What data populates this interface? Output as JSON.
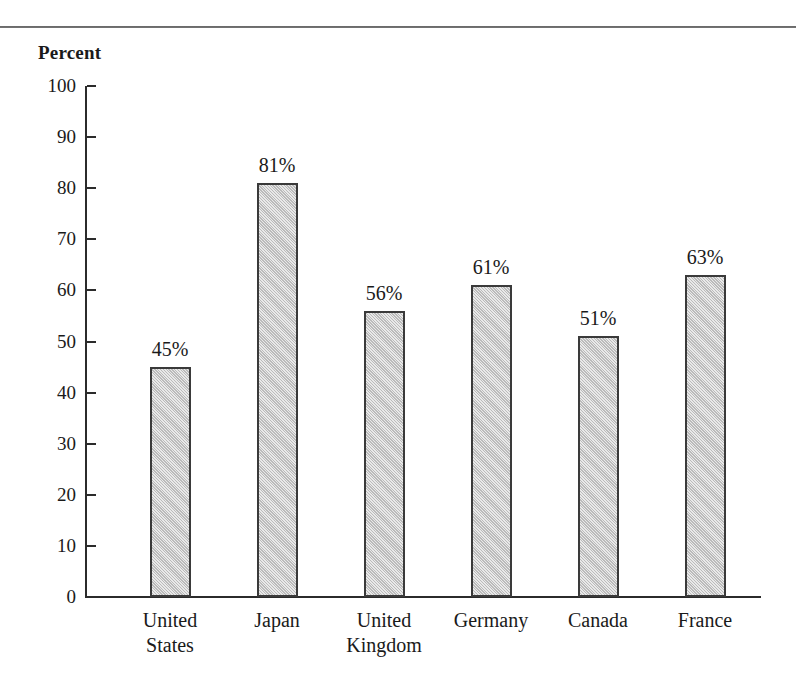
{
  "figure": {
    "axis_title": "Percent",
    "rule_color": "#4a4a4a",
    "bar_fill": "#cfcfcf",
    "bar_border": "#3a3a3a",
    "axis_color": "#2b2b2b",
    "background": "#ffffff"
  },
  "chart_data": {
    "type": "bar",
    "title": "",
    "subtitle": "",
    "xlabel": "",
    "ylabel": "Percent",
    "ylim": [
      0,
      100
    ],
    "yticks": [
      0,
      10,
      20,
      30,
      40,
      50,
      60,
      70,
      80,
      90,
      100
    ],
    "ytick_labels": [
      "0",
      "10",
      "20",
      "30",
      "40",
      "50",
      "60",
      "70",
      "80",
      "90",
      "100"
    ],
    "grid": false,
    "legend": null,
    "categories": [
      "United States",
      "Japan",
      "United Kingdom",
      "Germany",
      "Canada",
      "France"
    ],
    "category_lines": [
      [
        "United",
        "States"
      ],
      [
        "Japan"
      ],
      [
        "United",
        "Kingdom"
      ],
      [
        "Germany"
      ],
      [
        "Canada"
      ],
      [
        "France"
      ]
    ],
    "values": [
      45,
      81,
      56,
      61,
      51,
      63
    ],
    "data_labels": [
      "45%",
      "81%",
      "56%",
      "61%",
      "51%",
      "63%"
    ]
  }
}
